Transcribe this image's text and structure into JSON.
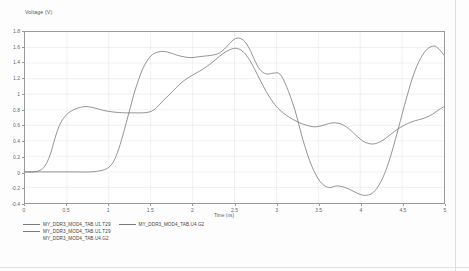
{
  "chart_data": {
    "type": "line",
    "title": "Voltage (V)",
    "xlabel": "Time (ns)",
    "ylabel": "Voltage (V)",
    "xlim": [
      0,
      5
    ],
    "ylim": [
      -0.4,
      1.8
    ],
    "grid": true,
    "legend_position": "bottom-left",
    "xticks": [
      "0",
      "0.5",
      "1",
      "1.5",
      "2",
      "2.5",
      "3",
      "3.5",
      "4",
      "4.5",
      "5"
    ],
    "xtick_values": [
      0,
      0.5,
      1,
      1.5,
      2,
      2.5,
      3,
      3.5,
      4,
      4.5,
      5
    ],
    "yticks": [
      "1.8",
      "1.6",
      "1.4",
      "1.2",
      "1",
      "0.8",
      "0.6",
      "0.4",
      "0.2",
      "0",
      "-0.2",
      "-0.4"
    ],
    "ytick_values": [
      1.8,
      1.6,
      1.4,
      1.2,
      1.0,
      0.8,
      0.6,
      0.4,
      0.2,
      0.0,
      -0.2,
      -0.4
    ],
    "series": [
      {
        "name": "MY_DDR3_MOD4_TAB.U1.T29",
        "color": "#707070",
        "x": [
          0.0,
          0.1,
          0.18,
          0.24,
          0.3,
          0.36,
          0.42,
          0.5,
          0.58,
          0.66,
          0.74,
          0.84,
          0.94,
          1.06,
          1.18,
          1.3,
          1.4,
          1.48,
          1.54,
          1.6,
          1.66,
          1.72,
          1.8,
          1.88,
          1.96,
          2.04,
          2.12,
          2.2,
          2.28,
          2.36,
          2.44,
          2.52,
          2.6,
          2.68,
          2.76,
          2.84,
          2.92,
          3.0,
          3.08,
          3.16,
          3.26,
          3.36,
          3.46,
          3.56,
          3.66,
          3.76,
          3.86,
          3.96,
          4.06,
          4.16,
          4.26,
          4.36,
          4.46,
          4.56,
          4.66,
          4.76,
          4.86,
          4.94,
          5.0
        ],
        "y": [
          0.0,
          0.0,
          0.02,
          0.08,
          0.22,
          0.44,
          0.62,
          0.74,
          0.8,
          0.83,
          0.84,
          0.82,
          0.79,
          0.77,
          0.76,
          0.76,
          0.76,
          0.77,
          0.8,
          0.86,
          0.93,
          0.99,
          1.08,
          1.16,
          1.22,
          1.27,
          1.32,
          1.38,
          1.45,
          1.52,
          1.57,
          1.59,
          1.55,
          1.44,
          1.28,
          1.11,
          0.96,
          0.84,
          0.76,
          0.7,
          0.64,
          0.6,
          0.58,
          0.6,
          0.63,
          0.62,
          0.56,
          0.46,
          0.38,
          0.36,
          0.4,
          0.48,
          0.56,
          0.62,
          0.66,
          0.69,
          0.74,
          0.8,
          0.84
        ]
      },
      {
        "name": "MY_DDR3_MOD4_TAB.U4.G2",
        "color": "#707070",
        "x": [
          0.0,
          0.2,
          0.4,
          0.6,
          0.78,
          0.92,
          1.0,
          1.06,
          1.12,
          1.18,
          1.24,
          1.3,
          1.36,
          1.42,
          1.5,
          1.58,
          1.66,
          1.74,
          1.82,
          1.9,
          1.98,
          2.06,
          2.14,
          2.22,
          2.3,
          2.38,
          2.44,
          2.5,
          2.56,
          2.62,
          2.68,
          2.74,
          2.8,
          2.88,
          2.96,
          3.04,
          3.12,
          3.22,
          3.32,
          3.42,
          3.52,
          3.62,
          3.72,
          3.82,
          3.92,
          4.0,
          4.08,
          4.16,
          4.24,
          4.32,
          4.4,
          4.48,
          4.56,
          4.64,
          4.72,
          4.8,
          4.88,
          4.94,
          5.0
        ],
        "y": [
          0.0,
          0.0,
          0.0,
          0.0,
          0.0,
          0.02,
          0.06,
          0.14,
          0.3,
          0.52,
          0.76,
          1.0,
          1.2,
          1.36,
          1.49,
          1.54,
          1.55,
          1.53,
          1.5,
          1.48,
          1.47,
          1.48,
          1.49,
          1.5,
          1.52,
          1.58,
          1.65,
          1.71,
          1.72,
          1.68,
          1.58,
          1.44,
          1.32,
          1.26,
          1.27,
          1.26,
          1.1,
          0.8,
          0.4,
          0.08,
          -0.12,
          -0.2,
          -0.18,
          -0.2,
          -0.25,
          -0.29,
          -0.3,
          -0.26,
          -0.14,
          0.06,
          0.34,
          0.66,
          0.98,
          1.26,
          1.46,
          1.58,
          1.62,
          1.58,
          1.5
        ]
      }
    ]
  },
  "legend": {
    "rows": [
      {
        "entries": [
          {
            "label": "MY_DDR3_MOD4_TAB.U1.T29",
            "swatch": true
          },
          {
            "label": "MY_DDR3_MOD4_TAB.U4.G2",
            "swatch": true
          }
        ]
      },
      {
        "entries": [
          {
            "label": "MY_DDR3_MOD4_TAB.U1.T29",
            "swatch": true
          }
        ]
      },
      {
        "entries": [
          {
            "label": "MY_DDR3_MOD4_TAB.U4.G2",
            "swatch": false
          }
        ]
      }
    ]
  }
}
